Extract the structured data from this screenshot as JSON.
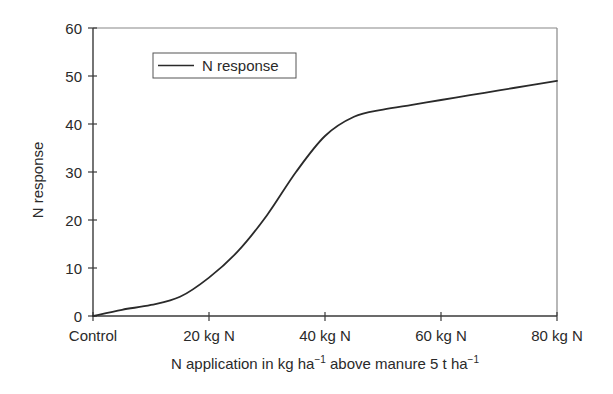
{
  "chart_data": {
    "type": "line",
    "title": "",
    "xlabel": "N application in kg ha⁻¹ above manure 5 t ha⁻¹",
    "xlabel_parts": {
      "part1": "N application in kg ha",
      "sup1": "−1",
      "part2": " above manure 5 t ha",
      "sup2": "−1"
    },
    "ylabel": "N response",
    "xlim": [
      0,
      80
    ],
    "ylim": [
      0,
      60
    ],
    "x_tick_values": [
      0,
      20,
      40,
      60,
      80
    ],
    "x_tick_labels": [
      "Control",
      "20 kg N",
      "40 kg N",
      "60 kg N",
      "80 kg N"
    ],
    "y_tick_values": [
      0,
      10,
      20,
      30,
      40,
      50,
      60
    ],
    "y_tick_labels": [
      "0",
      "10",
      "20",
      "30",
      "40",
      "50",
      "60"
    ],
    "grid": false,
    "legend_position": "upper left",
    "series": [
      {
        "name": "N response",
        "color": "#2a2a2a",
        "x": [
          0,
          5,
          10,
          15,
          20,
          25,
          30,
          35,
          40,
          45,
          50,
          55,
          60,
          65,
          70,
          75,
          80
        ],
        "values": [
          0,
          1.3,
          2.3,
          4.0,
          8.0,
          13.5,
          21.0,
          30.0,
          37.5,
          41.5,
          43.0,
          44.0,
          45.0,
          46.0,
          47.0,
          48.0,
          49.0
        ]
      }
    ]
  },
  "legend": {
    "label": "N response"
  }
}
